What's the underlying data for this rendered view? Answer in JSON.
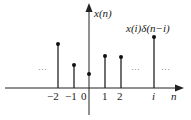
{
  "diagram": {
    "title": "",
    "y_axis_label": "x(n)",
    "x_axis_label": "n",
    "annotation": "x(i)δ(n−i)",
    "ellipsis": "···",
    "stems": [
      {
        "label": "−2",
        "x": 58,
        "top": 44
      },
      {
        "label": "−1",
        "x": 74,
        "top": 65
      },
      {
        "label": "0",
        "x": 89,
        "top": 74
      },
      {
        "label": "1",
        "x": 105,
        "top": 56
      },
      {
        "label": "2",
        "x": 121,
        "top": 57
      },
      {
        "label": "i",
        "x": 154,
        "top": 37
      }
    ],
    "tick_labels": [
      "−2",
      "−1",
      "0",
      "1",
      "2",
      "i"
    ]
  }
}
